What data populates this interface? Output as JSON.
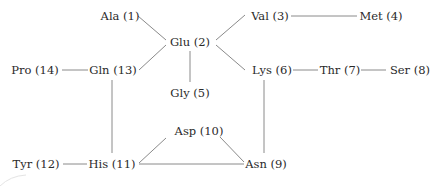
{
  "diagram": {
    "type": "graph",
    "nodes": [
      {
        "id": 1,
        "label": "Ala (1)",
        "x": 120,
        "y": 17,
        "anchor": "middle"
      },
      {
        "id": 2,
        "label": "Glu (2)",
        "x": 190,
        "y": 43,
        "anchor": "middle"
      },
      {
        "id": 3,
        "label": "Val (3)",
        "x": 270,
        "y": 17,
        "anchor": "middle"
      },
      {
        "id": 4,
        "label": "Met (4)",
        "x": 381,
        "y": 17,
        "anchor": "middle"
      },
      {
        "id": 5,
        "label": "Gly (5)",
        "x": 190,
        "y": 94,
        "anchor": "middle"
      },
      {
        "id": 6,
        "label": "Lys (6)",
        "x": 272,
        "y": 71,
        "anchor": "middle"
      },
      {
        "id": 7,
        "label": "Thr (7)",
        "x": 340,
        "y": 71,
        "anchor": "middle"
      },
      {
        "id": 8,
        "label": "Ser (8)",
        "x": 410,
        "y": 71,
        "anchor": "middle"
      },
      {
        "id": 9,
        "label": "Asn (9)",
        "x": 266,
        "y": 165,
        "anchor": "middle"
      },
      {
        "id": 10,
        "label": "Asp (10)",
        "x": 199,
        "y": 132,
        "anchor": "middle"
      },
      {
        "id": 11,
        "label": "His (11)",
        "x": 112,
        "y": 165,
        "anchor": "middle"
      },
      {
        "id": 12,
        "label": "Tyr (12)",
        "x": 36,
        "y": 165,
        "anchor": "middle"
      },
      {
        "id": 13,
        "label": "Gln (13)",
        "x": 113,
        "y": 71,
        "anchor": "middle"
      },
      {
        "id": 14,
        "label": "Pro (14)",
        "x": 35,
        "y": 71,
        "anchor": "middle"
      }
    ],
    "edges": [
      {
        "from": 1,
        "to": 2,
        "x1": 138,
        "y1": 16,
        "x2": 166,
        "y2": 40
      },
      {
        "from": 13,
        "to": 2,
        "x1": 139,
        "y1": 70,
        "x2": 166,
        "y2": 45
      },
      {
        "from": 2,
        "to": 3,
        "x1": 216,
        "y1": 40,
        "x2": 245,
        "y2": 15
      },
      {
        "from": 2,
        "to": 6,
        "x1": 216,
        "y1": 45,
        "x2": 245,
        "y2": 70
      },
      {
        "from": 2,
        "to": 5,
        "x1": 190,
        "y1": 51,
        "x2": 190,
        "y2": 82
      },
      {
        "from": 3,
        "to": 4,
        "x1": 291,
        "y1": 16,
        "x2": 357,
        "y2": 16
      },
      {
        "from": 14,
        "to": 13,
        "x1": 62,
        "y1": 70,
        "x2": 88,
        "y2": 70
      },
      {
        "from": 6,
        "to": 7,
        "x1": 293,
        "y1": 70,
        "x2": 318,
        "y2": 70
      },
      {
        "from": 7,
        "to": 8,
        "x1": 361,
        "y1": 70,
        "x2": 386,
        "y2": 70
      },
      {
        "from": 13,
        "to": 11,
        "x1": 112,
        "y1": 80,
        "x2": 112,
        "y2": 153
      },
      {
        "from": 6,
        "to": 9,
        "x1": 264,
        "y1": 80,
        "x2": 264,
        "y2": 153
      },
      {
        "from": 12,
        "to": 11,
        "x1": 63,
        "y1": 164,
        "x2": 87,
        "y2": 164
      },
      {
        "from": 11,
        "to": 10,
        "x1": 139,
        "y1": 163,
        "x2": 166,
        "y2": 138
      },
      {
        "from": 11,
        "to": 9,
        "x1": 139,
        "y1": 164,
        "x2": 244,
        "y2": 164
      },
      {
        "from": 10,
        "to": 9,
        "x1": 220,
        "y1": 137,
        "x2": 244,
        "y2": 162
      }
    ]
  }
}
